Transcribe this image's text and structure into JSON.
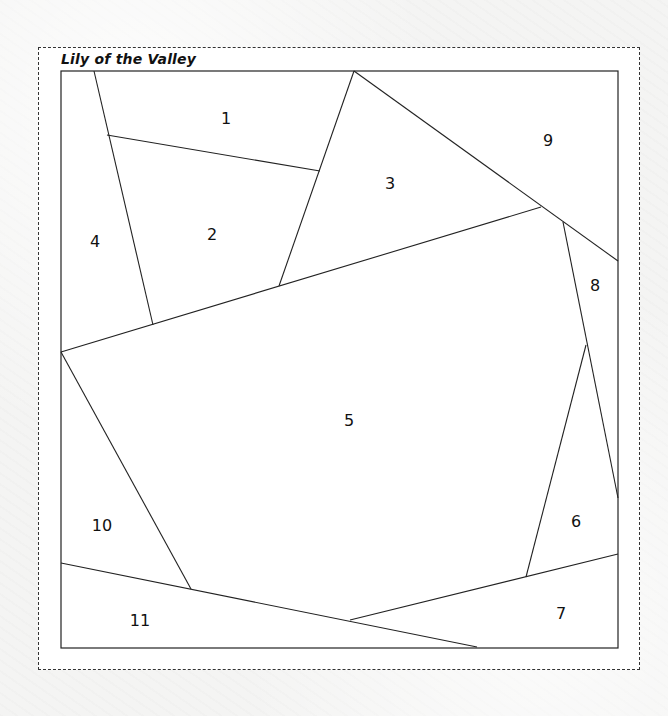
{
  "title": "Lily of the Valley",
  "colors": {
    "background": "#f4f4f3",
    "frame_fill": "#ffffff",
    "line": "#222222",
    "dashed_border": "#333333"
  },
  "pieces": [
    {
      "id": "1",
      "label": "1",
      "x": 226,
      "y": 119
    },
    {
      "id": "2",
      "label": "2",
      "x": 212,
      "y": 235
    },
    {
      "id": "3",
      "label": "3",
      "x": 390,
      "y": 184
    },
    {
      "id": "4",
      "label": "4",
      "x": 95,
      "y": 242
    },
    {
      "id": "5",
      "label": "5",
      "x": 349,
      "y": 421
    },
    {
      "id": "6",
      "label": "6",
      "x": 576,
      "y": 522
    },
    {
      "id": "7",
      "label": "7",
      "x": 561,
      "y": 614
    },
    {
      "id": "8",
      "label": "8",
      "x": 595,
      "y": 286
    },
    {
      "id": "9",
      "label": "9",
      "x": 548,
      "y": 141
    },
    {
      "id": "10",
      "label": "10",
      "x": 102,
      "y": 526
    },
    {
      "id": "11",
      "label": "11",
      "x": 140,
      "y": 621
    }
  ],
  "outer_block": {
    "x": 61,
    "y": 71,
    "w": 557,
    "h": 577
  },
  "seams": [
    {
      "name": "seam-4-2",
      "x1": 94,
      "y1": 71,
      "x2": 153,
      "y2": 325
    },
    {
      "name": "seam-1-2",
      "x1": 107,
      "y1": 135,
      "x2": 320,
      "y2": 171
    },
    {
      "name": "seam-2-3",
      "x1": 354,
      "y1": 71,
      "x2": 279,
      "y2": 286
    },
    {
      "name": "seam-3-9",
      "x1": 354,
      "y1": 71,
      "x2": 618,
      "y2": 261
    },
    {
      "name": "seam-top-5",
      "x1": 61,
      "y1": 352,
      "x2": 541,
      "y2": 207
    },
    {
      "name": "seam-5-8",
      "x1": 563,
      "y1": 222,
      "x2": 618,
      "y2": 498
    },
    {
      "name": "seam-5-6",
      "x1": 586,
      "y1": 345,
      "x2": 526,
      "y2": 577
    },
    {
      "name": "seam-6-7",
      "x1": 618,
      "y1": 554,
      "x2": 350,
      "y2": 620
    },
    {
      "name": "seam-10-11",
      "x1": 61,
      "y1": 563,
      "x2": 477,
      "y2": 647
    },
    {
      "name": "seam-5-10",
      "x1": 61,
      "y1": 352,
      "x2": 191,
      "y2": 589
    }
  ]
}
